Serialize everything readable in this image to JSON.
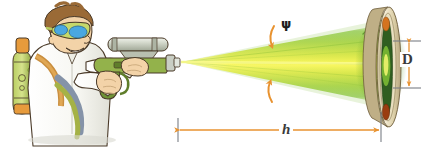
{
  "figure": {
    "background_color": "#ffffff",
    "labels": {
      "divergence_angle": "ψ",
      "distance": "h",
      "spot_diameter": "D"
    },
    "label_meanings": {
      "divergence_angle": "psi-beam-divergence-angle",
      "distance": "h-distance-to-target",
      "spot_diameter": "D-beam-spot-diameter"
    },
    "colors": {
      "dimension_line": "#E8922F",
      "tick_mark": "#7A7F86",
      "beam_core": "#F2F24A",
      "beam_mid": "#B9DC3C",
      "beam_edge": "#5FA72E",
      "label_text": "#3a3a3a",
      "coat_white": "#FBFBF8",
      "skin": "#F3D3A8",
      "hair": "#9A6A36",
      "goggles_lens": "#4AA7E0",
      "tank_green": "#A8C24E",
      "tank_orange": "#E79B3C",
      "gun_metal": "#C9CEC4",
      "gun_green": "#93B24B",
      "outline": "#4A3A28",
      "target_rim": "#EDE3C9",
      "target_inner": "#2F5E20",
      "target_spot": "#C8621E"
    },
    "elements": {
      "scientist": "cartoon-scientist-with-goggles-labcoat-and-backpack-tank",
      "laser_gun": "handheld-laser-rifle-with-scope",
      "beam": "diverging-conical-laser-beam",
      "target": "tilted-circular-target-disk",
      "psi_arcs": "two-orange-curved-arrows-marking-cone-angle",
      "h_dimension": "horizontal-double-headed-dimension-arrow",
      "d_dimension": "vertical-double-headed-dimension-arrow"
    },
    "geometry": {
      "beam_origin": {
        "x": 180,
        "y": 62
      },
      "target_center": {
        "x": 382,
        "y": 64
      },
      "h_line_y": 130,
      "h_left_x": 178,
      "h_right_x": 381,
      "d_line_x": 409,
      "d_top_y": 41,
      "d_bottom_y": 88
    }
  }
}
